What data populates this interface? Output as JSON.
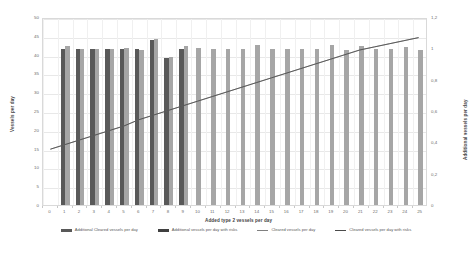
{
  "chart_data": {
    "type": "bar",
    "title": "",
    "xlabel": "Added type 2 vessels per day",
    "ylabel": "Vessels per day",
    "y2label": "Additional vessels per day",
    "grid": true,
    "legend_position": "bottom",
    "categories": [
      0,
      1,
      2,
      3,
      4,
      5,
      6,
      7,
      8,
      9,
      10,
      11,
      12,
      13,
      14,
      15,
      16,
      17,
      18,
      19,
      20,
      21,
      22,
      23,
      24,
      25
    ],
    "xtick_labels": [
      "0",
      "1",
      "2",
      "3",
      "4",
      "5",
      "6",
      "7",
      "8",
      "9",
      "10",
      "11",
      "12",
      "13",
      "14",
      "15",
      "16",
      "17",
      "18",
      "19",
      "20",
      "21",
      "22",
      "23",
      "24",
      "25"
    ],
    "ylim": [
      0,
      50
    ],
    "ytick_labels": [
      "0",
      "5",
      "10",
      "15",
      "20",
      "25",
      "30",
      "35",
      "40",
      "45",
      "50"
    ],
    "ytick_values": [
      0,
      5,
      10,
      15,
      20,
      25,
      30,
      35,
      40,
      45,
      50
    ],
    "y2lim": [
      0,
      1.2
    ],
    "y2tick_labels": [
      "0",
      "0,2",
      "0,4",
      "0,6",
      "0,8",
      "1",
      "1,2"
    ],
    "y2tick_values": [
      0,
      0.2,
      0.4,
      0.6,
      0.8,
      1.0,
      1.2
    ],
    "series": [
      {
        "name": "Cleared vessels per day",
        "kind": "bar",
        "color": "#595959",
        "axis": "left",
        "values": [
          null,
          41.6,
          41.5,
          41.5,
          41.5,
          41.5,
          41.6,
          44.0,
          39.0,
          41.5,
          null,
          null,
          null,
          null,
          null,
          null,
          null,
          null,
          null,
          null,
          null,
          null,
          null,
          null,
          null,
          null
        ]
      },
      {
        "name": "Cleared vessels per day with risks",
        "kind": "bar",
        "color": "#a6a6a6",
        "axis": "left",
        "values": [
          null,
          42.2,
          41.5,
          41.5,
          41.6,
          41.7,
          41.3,
          44.2,
          39.4,
          42.2,
          41.8,
          41.5,
          41.6,
          41.4,
          42.6,
          41.5,
          41.4,
          41.5,
          41.5,
          42.6,
          41.2,
          42.4,
          41.5,
          41.5,
          42.0,
          41.2
        ]
      },
      {
        "name": "Additional Cleared vessels per day",
        "kind": "line",
        "color": "#808080",
        "axis": "right",
        "values": [
          0.36,
          0.39,
          0.42,
          0.45,
          0.48,
          0.51,
          0.55,
          0.58,
          0.61,
          0.64,
          0.67,
          0.7,
          0.73,
          0.76,
          0.79,
          0.82,
          0.85,
          0.88,
          0.91,
          0.94,
          0.97,
          1.0,
          1.02,
          1.04,
          1.06,
          1.08
        ]
      },
      {
        "name": "Additional vessels per day with risks",
        "kind": "line",
        "color": "#4a4a4a",
        "axis": "right",
        "values": [
          0.36,
          0.39,
          0.42,
          0.45,
          0.48,
          0.51,
          0.55,
          0.58,
          0.61,
          0.64,
          0.67,
          0.7,
          0.73,
          0.76,
          0.79,
          0.82,
          0.85,
          0.88,
          0.91,
          0.94,
          0.97,
          1.0,
          1.02,
          1.04,
          1.06,
          1.08
        ]
      }
    ],
    "legend_entries": [
      {
        "label": "Additional Cleared vessels per day",
        "marker": "bar-dark"
      },
      {
        "label": "Additional vessels per day with risks",
        "marker": "bar-darker"
      },
      {
        "label": "Cleared vessels per day",
        "marker": "line-light"
      },
      {
        "label": "Cleared vessels per day with risks",
        "marker": "line-dark"
      }
    ]
  }
}
